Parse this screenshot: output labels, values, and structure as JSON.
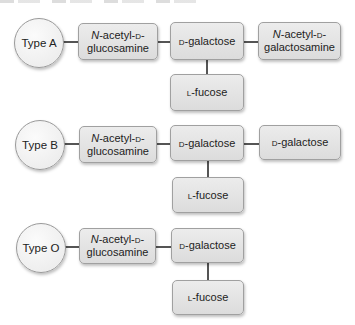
{
  "diagram": {
    "types": [
      {
        "label": "Type A",
        "chain": [
          {
            "prefix_italic": "N",
            "line1_rest": "-acetyl-",
            "line1_sc": "d",
            "line1_end": "-",
            "line2": "glucosamine"
          },
          {
            "sc": "d",
            "text": "-galactose"
          },
          {
            "prefix_italic": "N",
            "line1_rest": "-acetyl-",
            "line1_sc": "d",
            "line1_end": "-",
            "line2": "galactosamine"
          }
        ],
        "branch": {
          "sc": "l",
          "text": "-fucose"
        }
      },
      {
        "label": "Type B",
        "chain": [
          {
            "prefix_italic": "N",
            "line1_rest": "-acetyl-",
            "line1_sc": "d",
            "line1_end": "-",
            "line2": "glucosamine"
          },
          {
            "sc": "d",
            "text": "-galactose"
          },
          {
            "sc": "d",
            "text": "-galactose"
          }
        ],
        "branch": {
          "sc": "l",
          "text": "-fucose"
        }
      },
      {
        "label": "Type O",
        "chain": [
          {
            "prefix_italic": "N",
            "line1_rest": "-acetyl-",
            "line1_sc": "d",
            "line1_end": "-",
            "line2": "glucosamine"
          },
          {
            "sc": "d",
            "text": "-galactose"
          }
        ],
        "branch": {
          "sc": "l",
          "text": "-fucose"
        }
      }
    ],
    "colors": {
      "box_fill": "#e2e2e2",
      "circle_fill": "#f2f2f2",
      "border": "#a0a0a0",
      "connector": "#555555"
    }
  }
}
